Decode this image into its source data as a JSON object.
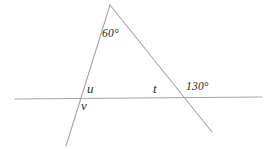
{
  "figure": {
    "canvas": {
      "width": 276,
      "height": 149,
      "background": "#ffffff"
    },
    "stroke_color": "#a6a6a6",
    "label_color": "#2b2b2b",
    "stroke_width": 1,
    "lines": [
      {
        "id": "transversal",
        "name": "horizontal-transversal-line",
        "x1": 15,
        "y1": 99,
        "x2": 262,
        "y2": 97
      },
      {
        "id": "left-ray",
        "name": "left-slanted-line",
        "x1": 110,
        "y1": 5,
        "x2": 66,
        "y2": 146
      },
      {
        "id": "right-ray",
        "name": "right-slanted-line",
        "x1": 110,
        "y1": 5,
        "x2": 212,
        "y2": 132
      }
    ],
    "vertices": [
      {
        "id": "apex",
        "name": "apex-point",
        "x": 110,
        "y": 5
      },
      {
        "id": "left-intersection",
        "name": "left-intersection-point",
        "x": 79,
        "y": 99
      },
      {
        "id": "right-intersection",
        "name": "right-intersection-point",
        "x": 183,
        "y": 98
      }
    ],
    "labels": {
      "apex_angle": "60°",
      "angle_u": "u",
      "angle_v": "v",
      "angle_t": "t",
      "exterior_angle": "130°"
    }
  }
}
